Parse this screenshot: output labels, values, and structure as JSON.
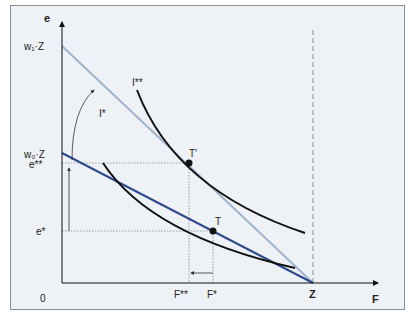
{
  "diagram": {
    "axes": {
      "y_label": "e",
      "x_label": "F",
      "origin_label": "0"
    },
    "y_ticks": {
      "w1z": "w₁·Z",
      "w0z": "w₀·Z",
      "e_star_star": "e**",
      "e_star": "e*"
    },
    "x_ticks": {
      "f_star_star": "F**",
      "f_star": "F*",
      "z": "Z"
    },
    "curves": {
      "i_star": "I*",
      "i_star_star": "I**"
    },
    "points": {
      "t": "T",
      "t_prime": "T'"
    },
    "colors": {
      "frame_bg": "#eef1f6",
      "budget_w1": "#9fb4cc",
      "budget_w0": "#2e4a8c",
      "indifference": "#111111",
      "guides": "#888888"
    }
  }
}
